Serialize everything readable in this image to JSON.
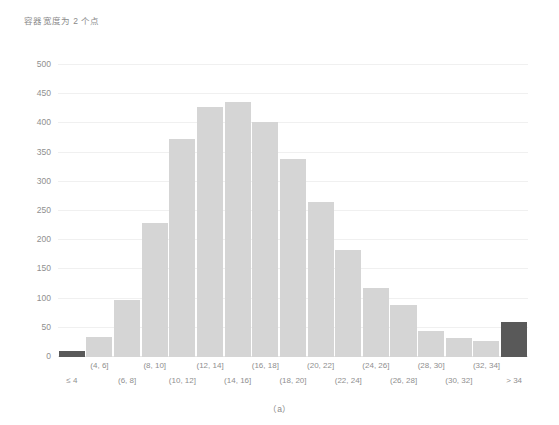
{
  "chart_data": {
    "type": "bar",
    "title": "容器宽度为 2 个点",
    "caption": "（a）",
    "xlabel": "",
    "ylabel": "",
    "ylim": [
      0,
      500
    ],
    "ytick_step": 50,
    "yticks": [
      0,
      50,
      100,
      150,
      200,
      250,
      300,
      350,
      400,
      450,
      500
    ],
    "grid": true,
    "legend": "none",
    "categories": [
      "≤ 4",
      "(4, 6]",
      "(6, 8]",
      "(8, 10]",
      "(10, 12]",
      "(12, 14]",
      "(14, 16]",
      "(16, 18]",
      "(18, 20]",
      "(20, 22]",
      "(22, 24]",
      "(24, 26]",
      "(26, 28]",
      "(28, 30]",
      "(30, 32]",
      "(32, 34]",
      "> 34"
    ],
    "values": [
      10,
      35,
      97,
      229,
      373,
      428,
      437,
      402,
      339,
      265,
      184,
      118,
      89,
      45,
      33,
      28,
      60
    ],
    "bar_colors": [
      "#595959",
      "#d5d5d5",
      "#d5d5d5",
      "#d5d5d5",
      "#d5d5d5",
      "#d5d5d5",
      "#d5d5d5",
      "#d5d5d5",
      "#d5d5d5",
      "#d5d5d5",
      "#d5d5d5",
      "#d5d5d5",
      "#d5d5d5",
      "#d5d5d5",
      "#d5d5d5",
      "#d5d5d5",
      "#595959"
    ],
    "label_rows": [
      1,
      0,
      1,
      0,
      1,
      0,
      1,
      0,
      1,
      0,
      1,
      0,
      1,
      0,
      1,
      0,
      1
    ],
    "colors": {
      "bar_default": "#d5d5d5",
      "bar_accent": "#595959",
      "gridline": "#f0f0f0",
      "axis": "#e6e6e6",
      "text": "#8f8f8f",
      "background": "#ffffff"
    }
  }
}
